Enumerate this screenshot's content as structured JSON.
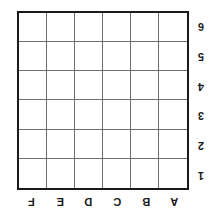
{
  "board": {
    "type": "coordinate-grid",
    "orientation": "rotated-180",
    "columns": 6,
    "rows": 6,
    "column_labels": [
      "F",
      "E",
      "D",
      "C",
      "B",
      "A"
    ],
    "row_labels": [
      "6",
      "5",
      "4",
      "3",
      "2",
      "1"
    ],
    "cells": [
      [
        "",
        "",
        "",
        "",
        "",
        ""
      ],
      [
        "",
        "",
        "",
        "",
        "",
        ""
      ],
      [
        "",
        "",
        "",
        "",
        "",
        ""
      ],
      [
        "",
        "",
        "",
        "",
        "",
        ""
      ],
      [
        "",
        "",
        "",
        "",
        "",
        ""
      ],
      [
        "",
        "",
        "",
        "",
        "",
        ""
      ]
    ],
    "colors": {
      "background": "#ffffff",
      "cell_fill": "#ffffff",
      "outer_border": "#1a1a1a",
      "inner_line": "#6e6e6e",
      "label_text": "#1a1a1a"
    }
  }
}
